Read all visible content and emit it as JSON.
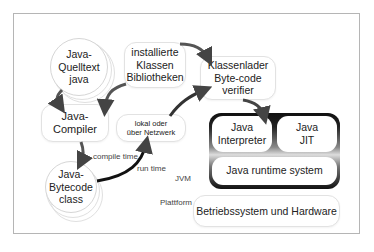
{
  "diagram": {
    "nodes": {
      "source": {
        "line1": "Java-",
        "line2": "Quelltext",
        "line3": "java"
      },
      "libs": {
        "line1": "installierte",
        "line2": "Klassen",
        "line3": "Bibliotheken"
      },
      "loader": {
        "line1": "Klassenlader",
        "line2": "Byte-code",
        "line3": "verifier"
      },
      "compiler": {
        "line1": "Java-",
        "line2": "Compiler"
      },
      "network": {
        "line1": "lokal oder",
        "line2": "über Netzwerk"
      },
      "bytecode": {
        "line1": "Java-",
        "line2": "Bytecode",
        "line3": "class"
      },
      "interpreter": {
        "line1": "Java",
        "line2": "Interpreter"
      },
      "jit": {
        "line1": "Java",
        "line2": "JIT"
      },
      "runtime": {
        "label": "Java runtime system"
      },
      "os": {
        "label": "Betriebssystem und Hardware"
      }
    },
    "labels": {
      "compile_time": "compile time",
      "run_time": "run time",
      "jvm": "JVM",
      "platform": "Plattform"
    },
    "colors": {
      "frame": "#b5b5b5",
      "arrow": "#1a1a1a",
      "jvm_border": "#111111"
    }
  }
}
